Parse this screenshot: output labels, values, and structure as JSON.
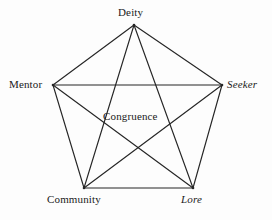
{
  "diagram": {
    "type": "complete-graph-k5",
    "background_color": "#fdfdfd",
    "line_color": "#262626",
    "text_color": "#1a1a1a",
    "center": {
      "label": "Congruence"
    },
    "nodes": [
      {
        "id": "deity",
        "label": "Deity",
        "x": 134,
        "y": 25,
        "style": "regular"
      },
      {
        "id": "mentor",
        "label": "Mentor",
        "x": 53,
        "y": 85,
        "style": "regular"
      },
      {
        "id": "seeker",
        "label": "Seeker",
        "x": 222,
        "y": 85,
        "style": "italic"
      },
      {
        "id": "community",
        "label": "Community",
        "x": 84,
        "y": 188,
        "style": "regular"
      },
      {
        "id": "lore",
        "label": "Lore",
        "x": 193,
        "y": 188,
        "style": "italic"
      }
    ],
    "edges": [
      {
        "from": "deity",
        "to": "mentor"
      },
      {
        "from": "deity",
        "to": "seeker"
      },
      {
        "from": "deity",
        "to": "community"
      },
      {
        "from": "deity",
        "to": "lore"
      },
      {
        "from": "mentor",
        "to": "seeker"
      },
      {
        "from": "mentor",
        "to": "community"
      },
      {
        "from": "mentor",
        "to": "lore"
      },
      {
        "from": "seeker",
        "to": "community"
      },
      {
        "from": "seeker",
        "to": "lore"
      },
      {
        "from": "community",
        "to": "lore"
      }
    ]
  }
}
